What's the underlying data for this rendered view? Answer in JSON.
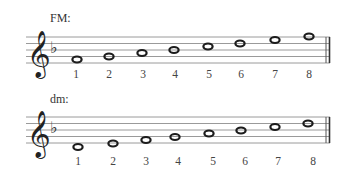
{
  "examples": [
    {
      "id": "fm",
      "title": "FM:",
      "key_signature": "one flat (B♭)",
      "clef": "treble",
      "degrees": [
        "1",
        "2",
        "3",
        "4",
        "5",
        "6",
        "7",
        "8"
      ]
    },
    {
      "id": "dm",
      "title": "dm:",
      "key_signature": "one flat (B♭)",
      "clef": "treble",
      "degrees": [
        "1",
        "2",
        "3",
        "4",
        "5",
        "6",
        "7",
        "8"
      ]
    }
  ],
  "colors": {
    "staff_line": "#9a9a9a",
    "note": "#222222",
    "text": "#333333"
  }
}
